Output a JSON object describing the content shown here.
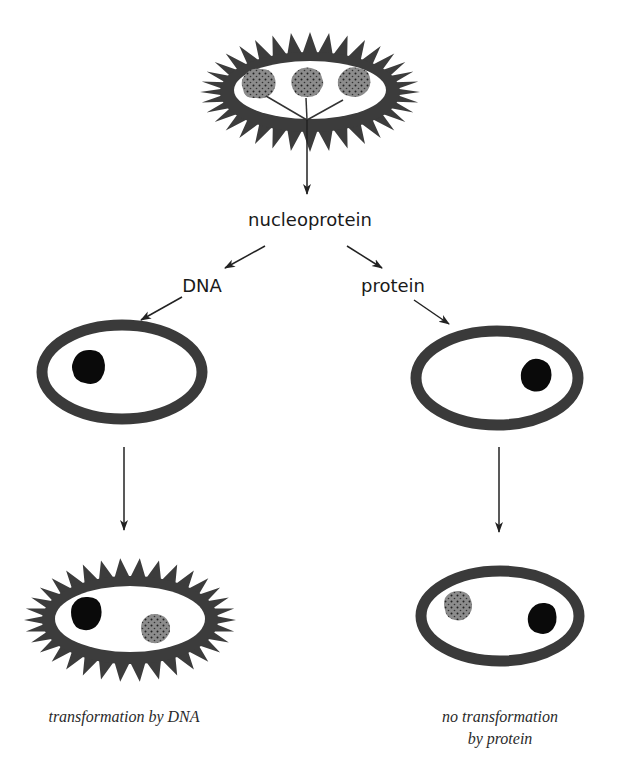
{
  "diagram": {
    "type": "flow",
    "nodes": {
      "source_cell": {
        "shape": "spiky-capsule-ellipse",
        "contents": [
          "stippled-chromosome",
          "stippled-chromosome",
          "stippled-chromosome"
        ]
      },
      "nucleoprotein_label": "nucleoprotein",
      "dna_label": "DNA",
      "protein_label": "protein",
      "recipient_cell_left": {
        "shape": "smooth-ellipse",
        "contents": [
          "black-chromosome"
        ]
      },
      "recipient_cell_right": {
        "shape": "smooth-ellipse",
        "contents": [
          "black-chromosome"
        ]
      },
      "result_cell_left": {
        "shape": "spiky-capsule-ellipse",
        "contents": [
          "black-chromosome",
          "stippled-chromosome"
        ]
      },
      "result_cell_right": {
        "shape": "smooth-ellipse",
        "contents": [
          "stippled-chromosome",
          "black-chromosome"
        ]
      }
    },
    "captions": {
      "left": "transformation by DNA",
      "right_line1": "no transformation",
      "right_line2": "by protein"
    },
    "colors": {
      "outline": "#3a3a3a",
      "capsule": "#3c3c3c",
      "black_chromosome": "#0a0a0a",
      "stippled_chromosome": "#8a8a8a",
      "stipple_dot": "#222222",
      "arrow": "#222222"
    }
  }
}
